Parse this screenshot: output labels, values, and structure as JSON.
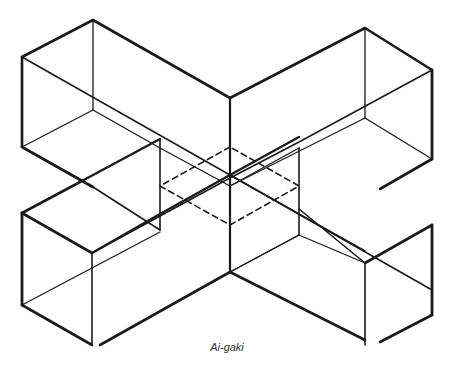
{
  "figure": {
    "caption": "Ai-gaki",
    "colors": {
      "line": "#1a1a1a",
      "background": "#ffffff"
    }
  },
  "elements": {
    "beam_a": "beam running from upper-left to lower-right",
    "beam_b": "beam running from upper-right to lower-left",
    "joint_outline": "dashed square showing hidden joint intersection"
  }
}
